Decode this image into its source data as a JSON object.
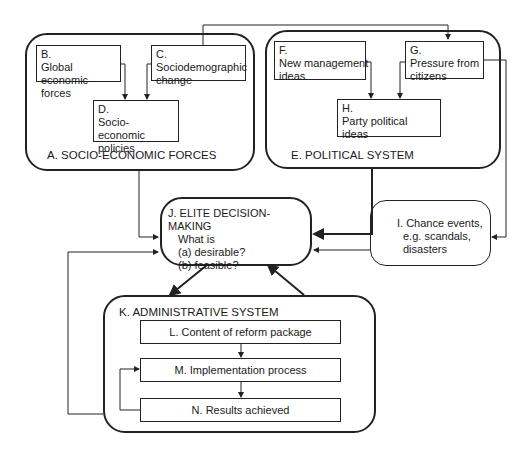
{
  "diagram": {
    "A": {
      "label": "A. SOCIO-ECONOMIC FORCES"
    },
    "B": {
      "id": "B.",
      "text": "Global economic forces"
    },
    "C": {
      "id": "C.",
      "text": "Sociodemographic change"
    },
    "D": {
      "id": "D.",
      "text": "Socio-economic policies"
    },
    "E": {
      "label": "E. POLITICAL SYSTEM"
    },
    "F": {
      "id": "F.",
      "text": "New management ideas"
    },
    "G": {
      "id": "G.",
      "text": "Pressure from citizens"
    },
    "H": {
      "id": "H.",
      "text": "Party political ideas"
    },
    "I": {
      "line1": "I. Chance events,",
      "line2": "e.g. scandals,",
      "line3": "disasters"
    },
    "J": {
      "title": "J. ELITE DECISION-MAKING",
      "line1": "What is",
      "line2": "(a) desirable?",
      "line3": "(b) feasible?"
    },
    "K": {
      "label": "K. ADMINISTRATIVE SYSTEM"
    },
    "L": {
      "text": "L. Content of reform package"
    },
    "M": {
      "text": "M. Implementation process"
    },
    "N": {
      "text": "N. Results achieved"
    }
  },
  "edges": [
    [
      "B",
      "D"
    ],
    [
      "C",
      "D"
    ],
    [
      "C",
      "G"
    ],
    [
      "F",
      "H"
    ],
    [
      "G",
      "H"
    ],
    [
      "G",
      "I"
    ],
    [
      "A",
      "J"
    ],
    [
      "E",
      "J"
    ],
    [
      "I",
      "J"
    ],
    [
      "J",
      "K"
    ],
    [
      "K",
      "J"
    ],
    [
      "L",
      "M"
    ],
    [
      "M",
      "N"
    ],
    [
      "N",
      "M"
    ],
    [
      "N",
      "J"
    ]
  ]
}
